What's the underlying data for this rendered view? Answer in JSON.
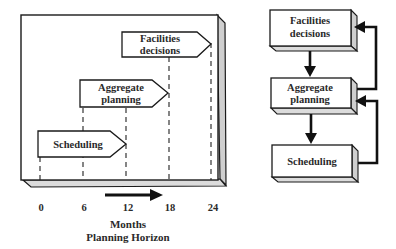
{
  "left_panel": {
    "arrows": [
      {
        "id": "scheduling",
        "lines": [
          "Scheduling"
        ],
        "start_month": 0,
        "end_month": 12
      },
      {
        "id": "aggregate",
        "lines": [
          "Aggregate",
          "planning"
        ],
        "start_month": 6,
        "end_month": 18
      },
      {
        "id": "facilities",
        "lines": [
          "Facilities",
          "decisions"
        ],
        "start_month": 12,
        "end_month": 24
      }
    ],
    "ticks": [
      "0",
      "6",
      "12",
      "18",
      "24"
    ],
    "axis_title_line1": "Months",
    "axis_title_line2": "Planning Horizon"
  },
  "right_panel": {
    "boxes": [
      {
        "id": "facilities",
        "lines": [
          "Facilities",
          "decisions"
        ]
      },
      {
        "id": "aggregate",
        "lines": [
          "Aggregate",
          "planning"
        ]
      },
      {
        "id": "scheduling",
        "lines": [
          "Scheduling"
        ]
      }
    ]
  },
  "colors": {
    "stroke": "#1a1a1a",
    "face": "#ffffff",
    "side": "#cfcfcf",
    "bottom": "#dcdcdc",
    "text": "#2a2a2a"
  }
}
